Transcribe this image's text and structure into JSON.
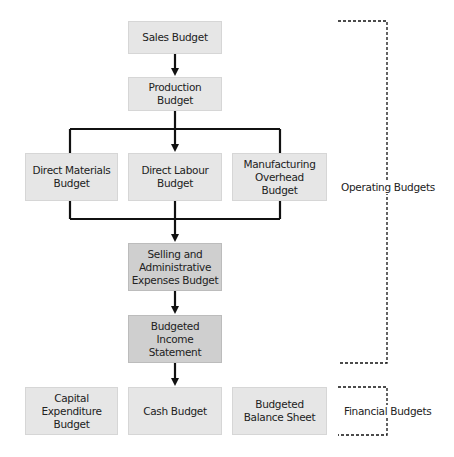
{
  "diagram": {
    "nodes": {
      "sales": "Sales Budget",
      "production": "Production Budget",
      "direct_materials": "Direct Materials Budget",
      "direct_labour": "Direct Labour Budget",
      "manufacturing_overhead": "Manufacturing Overhead Budget",
      "selling_admin": "Selling and Administrative Expenses Budget",
      "income_statement": "Budgeted Income Statement",
      "capital_expenditure": "Capital Expenditure Budget",
      "cash": "Cash Budget",
      "balance_sheet": "Budgeted Balance Sheet"
    },
    "groups": {
      "operating": "Operating Budgets",
      "financial": "Financial Budgets"
    },
    "colors": {
      "box_light": "#e6e6e6",
      "box_dark": "#cfcfcf",
      "line": "#111111"
    }
  }
}
